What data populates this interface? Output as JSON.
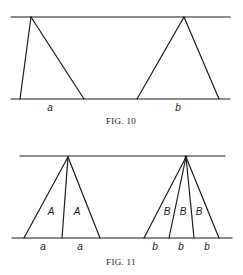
{
  "figures": [
    {
      "id": "fig10",
      "caption": "Fig. 10",
      "caption_display": "FIG. 10",
      "top_line": {
        "x1": 11,
        "x2": 230,
        "y": 17
      },
      "bottom_line": {
        "x1": 11,
        "x2": 230,
        "y": 99
      },
      "triangles": [
        {
          "name": "triangle-a",
          "apex": [
            31,
            17
          ],
          "base_points": [
            [
              20,
              99
            ],
            [
              84,
              99
            ]
          ],
          "base_labels": [
            "a"
          ]
        },
        {
          "name": "triangle-b",
          "apex": [
            184,
            17
          ],
          "base_points": [
            [
              137,
              99
            ],
            [
              219,
              99
            ]
          ],
          "base_labels": [
            "b"
          ]
        }
      ]
    },
    {
      "id": "fig11",
      "caption": "Fig. 11",
      "caption_display": "FIG. 11",
      "top_line": {
        "x1": 20,
        "x2": 225,
        "y": 156
      },
      "bottom_line": {
        "x1": 12,
        "x2": 232,
        "y": 238
      },
      "triangles": [
        {
          "name": "fan-A",
          "apex": [
            68,
            157
          ],
          "base_points": [
            [
              24,
              238
            ],
            [
              62,
              238
            ],
            [
              100,
              238
            ]
          ],
          "region_labels": [
            "A",
            "A"
          ],
          "base_labels": [
            "a",
            "a"
          ]
        },
        {
          "name": "fan-B",
          "apex": [
            186,
            157
          ],
          "base_points": [
            [
              144,
              238
            ],
            [
              169,
              238
            ],
            [
              194,
              238
            ],
            [
              219,
              238
            ]
          ],
          "region_labels": [
            "B",
            "B",
            "B"
          ],
          "base_labels": [
            "b",
            "b",
            "b"
          ]
        }
      ]
    }
  ],
  "labels": {
    "fig10_a": "a",
    "fig10_b": "b",
    "fig10_caption": "FIG. 10",
    "fig11_A1": "A",
    "fig11_A2": "A",
    "fig11_B1": "B",
    "fig11_B2": "B",
    "fig11_B3": "B",
    "fig11_a1": "a",
    "fig11_a2": "a",
    "fig11_b1": "b",
    "fig11_b2": "b",
    "fig11_b3": "b",
    "fig11_caption": "FIG. 11"
  },
  "colors": {
    "ink": "#1a1a1a",
    "paper": "#ffffff"
  }
}
